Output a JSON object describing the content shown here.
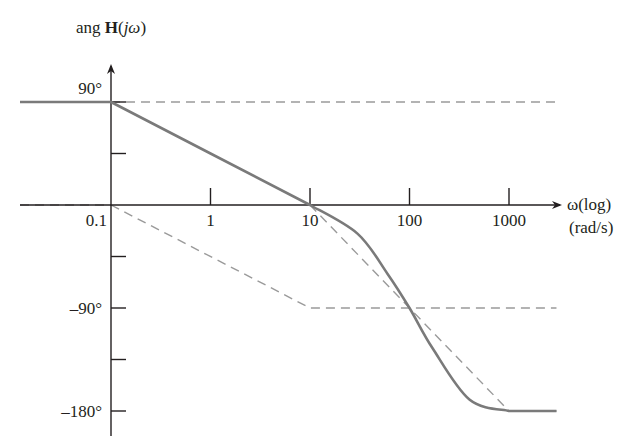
{
  "chart_data": {
    "type": "line",
    "title": "",
    "ylabel": "ang H(jω)",
    "ylabel_parts": {
      "prefix": "ang ",
      "bold": "H",
      "suffix_open": "(",
      "italic": "jω",
      "suffix_close": ")"
    },
    "xlabel": "ω(log) (rad/s)",
    "xlabel_lines": [
      "ω(log)",
      "(rad/s)"
    ],
    "x_scale": "log",
    "x_ticks": [
      0.1,
      1,
      10,
      100,
      1000
    ],
    "x_tick_labels": [
      "0.1",
      "1",
      "10",
      "100",
      "1000"
    ],
    "y_ticks": [
      90,
      45,
      0,
      -45,
      -90,
      -135,
      -180
    ],
    "y_tick_labels": {
      "90": "90°",
      "-90": "–90°",
      "-180": "–180°"
    },
    "ylim": [
      -180,
      90
    ],
    "grid": false,
    "legend": null,
    "series": [
      {
        "name": "Total phase (solid)",
        "style": "solid",
        "points": [
          [
            0.01,
            90
          ],
          [
            0.1,
            90
          ],
          [
            1,
            45
          ],
          [
            10,
            0
          ],
          [
            30,
            -25
          ],
          [
            60,
            -60
          ],
          [
            100,
            -90
          ],
          [
            170,
            -125
          ],
          [
            400,
            -170
          ],
          [
            1000,
            -180
          ],
          [
            3000,
            -180
          ]
        ]
      },
      {
        "name": "Asymptote +90° (dashed)",
        "style": "dashed",
        "points": [
          [
            0.1,
            90
          ],
          [
            3000,
            90
          ]
        ]
      },
      {
        "name": "Asymptote 0° (dashed)",
        "style": "dashed",
        "points": [
          [
            0.01,
            0
          ],
          [
            0.1,
            0
          ]
        ]
      },
      {
        "name": "Asymptote pole at 1 (dashed)",
        "style": "dashed",
        "points": [
          [
            0.1,
            0
          ],
          [
            10,
            -90
          ],
          [
            3000,
            -90
          ]
        ]
      },
      {
        "name": "Asymptote double pole at 100 (dashed)",
        "style": "dashed",
        "points": [
          [
            10,
            0
          ],
          [
            1000,
            -180
          ],
          [
            3000,
            -180
          ]
        ]
      }
    ]
  },
  "colors": {
    "axis": "#231f20",
    "curve": "#7a7a7a",
    "dashed": "#9a9a9a"
  }
}
